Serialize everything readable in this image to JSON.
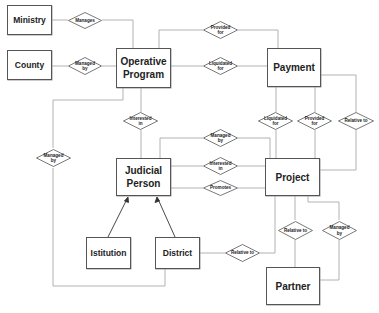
{
  "entities": {
    "ministry": "Ministry",
    "county": "County",
    "operative_program": "Operative Program",
    "payment": "Payment",
    "judicial_person": "Judicial Person",
    "project": "Project",
    "istitution": "Istitution",
    "district": "District",
    "partner": "Partner"
  },
  "relationships": {
    "ministry_op": "Manages",
    "county_op": "Managed by",
    "op_payment_provided": "Provided for",
    "op_payment_liquidated": "Liquidated for",
    "op_jp_interested": "Interested in",
    "op_district_managed": "Managed by",
    "payment_project_liquidated": "Liquidated for",
    "payment_project_provided": "Provided for",
    "payment_project_relative": "Relative to",
    "jp_project_managed": "Managed by",
    "jp_project_interested": "Interested in",
    "jp_project_promotes": "Promotes",
    "project_partner_relative": "Relative to",
    "project_partner_managed": "Managed by",
    "district_project_relative": "Relative to"
  },
  "colors": {
    "line": "#9a9a9a",
    "border": "#555555",
    "text": "#222222"
  }
}
